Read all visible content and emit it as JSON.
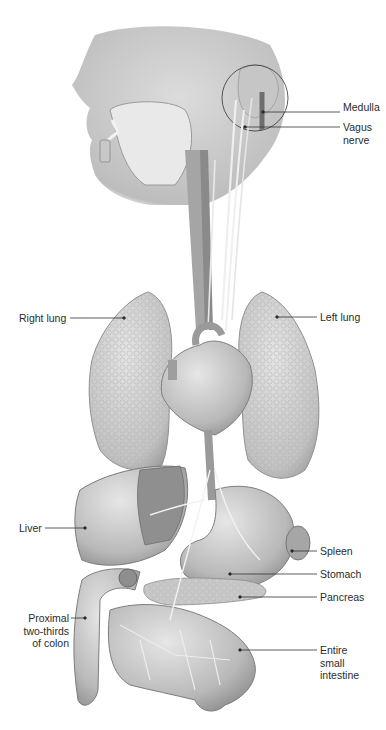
{
  "figure": {
    "colors": {
      "background": "#ffffff",
      "organ_light": "#d9d9d9",
      "organ_mid": "#b4b4b4",
      "organ_dark": "#8a8a8a",
      "nerve": "#efefef",
      "line": "#333333",
      "text": "#2b2b2b"
    },
    "labels": [
      {
        "id": "medulla",
        "text": "Medulla",
        "x": 343,
        "y": 107
      },
      {
        "id": "vagus-nerve",
        "text": "Vagus\nnerve",
        "x": 343,
        "y": 122
      },
      {
        "id": "right-lung",
        "text": "Right lung",
        "x": 19,
        "y": 313
      },
      {
        "id": "left-lung",
        "text": "Left lung",
        "x": 320,
        "y": 312
      },
      {
        "id": "liver",
        "text": "Liver",
        "x": 19,
        "y": 521
      },
      {
        "id": "spleen",
        "text": "Spleen",
        "x": 320,
        "y": 546
      },
      {
        "id": "stomach",
        "text": "Stomach",
        "x": 320,
        "y": 567
      },
      {
        "id": "pancreas",
        "text": "Pancreas",
        "x": 320,
        "y": 589
      },
      {
        "id": "proximal-colon",
        "text": "Proximal\ntwo-thirds\nof colon",
        "x": 20,
        "y": 612
      },
      {
        "id": "small-intestine",
        "text": "Entire\nsmall\nintestine",
        "x": 320,
        "y": 641
      }
    ]
  }
}
